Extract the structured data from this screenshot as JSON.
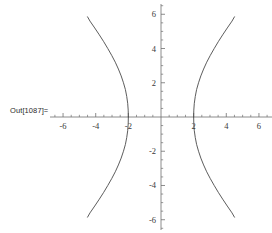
{
  "cell": {
    "out_label": "Out[1087]="
  },
  "chart_data": {
    "type": "line",
    "title": "",
    "xlabel": "",
    "ylabel": "",
    "xlim": [
      -6.8,
      6.8
    ],
    "ylim": [
      -6.6,
      6.6
    ],
    "grid": false,
    "legend": null,
    "axes_style": "cross-through-origin",
    "x_ticks_major": [
      -6,
      -4,
      -2,
      2,
      4,
      6
    ],
    "x_ticks_major_labels": [
      "-6",
      "-4",
      "-2",
      "2",
      "4",
      "6"
    ],
    "x_ticks_minor": [
      -6.5,
      -5.5,
      -5,
      -4.5,
      -3.5,
      -3,
      -2.5,
      -1.5,
      -1,
      -0.5,
      0.5,
      1,
      1.5,
      2.5,
      3,
      3.5,
      4.5,
      5,
      5.5,
      6.5
    ],
    "y_ticks_major": [
      -6,
      -4,
      -2,
      2,
      4,
      6
    ],
    "y_ticks_major_labels": [
      "-6",
      "-4",
      "-2",
      "2",
      "4",
      "6"
    ],
    "y_ticks_minor": [
      -6.5,
      -5.5,
      -5,
      -4.5,
      -3.5,
      -3,
      -2.5,
      -1.5,
      -1,
      -0.5,
      0.5,
      1,
      1.5,
      2.5,
      3,
      3.5,
      4.5,
      5,
      5.5,
      6.5
    ],
    "curve_color": "#4a4a4a",
    "axis_color": "#707070",
    "series": [
      {
        "name": "right-branch",
        "points": [
          [
            2.0,
            0.0
          ],
          [
            2.01,
            0.4
          ],
          [
            2.04,
            0.8
          ],
          [
            2.1,
            1.2
          ],
          [
            2.18,
            1.6
          ],
          [
            2.3,
            2.0
          ],
          [
            2.44,
            2.4
          ],
          [
            2.61,
            2.8
          ],
          [
            2.8,
            3.2
          ],
          [
            3.02,
            3.6
          ],
          [
            3.26,
            4.0
          ],
          [
            3.51,
            4.4
          ],
          [
            3.78,
            4.8
          ],
          [
            4.06,
            5.2
          ],
          [
            4.35,
            5.6
          ],
          [
            4.5,
            5.85
          ]
        ]
      },
      {
        "name": "right-branch-lower",
        "points": [
          [
            2.0,
            0.0
          ],
          [
            2.01,
            -0.4
          ],
          [
            2.04,
            -0.8
          ],
          [
            2.1,
            -1.2
          ],
          [
            2.18,
            -1.6
          ],
          [
            2.3,
            -2.0
          ],
          [
            2.44,
            -2.4
          ],
          [
            2.61,
            -2.8
          ],
          [
            2.8,
            -3.2
          ],
          [
            3.02,
            -3.6
          ],
          [
            3.26,
            -4.0
          ],
          [
            3.51,
            -4.4
          ],
          [
            3.78,
            -4.8
          ],
          [
            4.06,
            -5.2
          ],
          [
            4.35,
            -5.6
          ],
          [
            4.5,
            -5.85
          ]
        ]
      },
      {
        "name": "left-branch",
        "points": [
          [
            -2.0,
            0.0
          ],
          [
            -2.01,
            0.4
          ],
          [
            -2.04,
            0.8
          ],
          [
            -2.1,
            1.2
          ],
          [
            -2.18,
            1.6
          ],
          [
            -2.3,
            2.0
          ],
          [
            -2.44,
            2.4
          ],
          [
            -2.61,
            2.8
          ],
          [
            -2.8,
            3.2
          ],
          [
            -3.02,
            3.6
          ],
          [
            -3.26,
            4.0
          ],
          [
            -3.51,
            4.4
          ],
          [
            -3.78,
            4.8
          ],
          [
            -4.06,
            5.2
          ],
          [
            -4.35,
            5.6
          ],
          [
            -4.5,
            5.85
          ]
        ]
      },
      {
        "name": "left-branch-lower",
        "points": [
          [
            -2.0,
            0.0
          ],
          [
            -2.01,
            -0.4
          ],
          [
            -2.04,
            -0.8
          ],
          [
            -2.1,
            -1.2
          ],
          [
            -2.18,
            -1.6
          ],
          [
            -2.3,
            -2.0
          ],
          [
            -2.44,
            -2.4
          ],
          [
            -2.61,
            -2.8
          ],
          [
            -2.8,
            -3.2
          ],
          [
            -3.02,
            -3.6
          ],
          [
            -3.26,
            -4.0
          ],
          [
            -3.51,
            -4.4
          ],
          [
            -3.78,
            -4.8
          ],
          [
            -4.06,
            -5.2
          ],
          [
            -4.35,
            -5.6
          ],
          [
            -4.5,
            -5.85
          ]
        ]
      }
    ]
  }
}
